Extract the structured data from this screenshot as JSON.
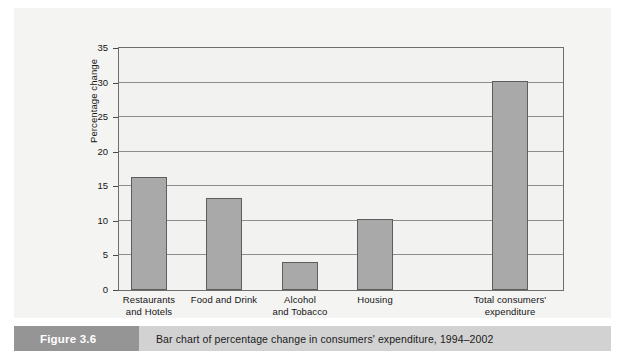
{
  "figure": {
    "tag_label": "Figure 3.6",
    "caption": "Bar chart of percentage change in consumers' expenditure, 1994–2002"
  },
  "colors": {
    "bar_fill": "#a9a9a9",
    "bar_outline": "#5d5d5d",
    "plot_background": "#f2f2f1",
    "panel_background": "#f4f4f3",
    "gridline": "#8d8d8d",
    "caption_bar": "#d2d2d2",
    "caption_tag": "#959595"
  },
  "chart_data": {
    "type": "bar",
    "title": "",
    "xlabel": "",
    "ylabel": "Percentage change",
    "ylim": [
      0,
      35
    ],
    "yticks": [
      0,
      5,
      10,
      15,
      20,
      25,
      30,
      35
    ],
    "ytick_labels": [
      "0",
      "5",
      "10",
      "15",
      "20",
      "25",
      "30",
      "35"
    ],
    "grid": "horizontal",
    "legend": "none",
    "categories": [
      "Restaurants and Hotels",
      "Food and Drink",
      "Alcohol and Tobacco",
      "Housing",
      "Total consumers' expenditure"
    ],
    "category_lines": [
      [
        "Restaurants",
        "and Hotels"
      ],
      [
        "Food and Drink"
      ],
      [
        "Alcohol",
        "and Tobacco"
      ],
      [
        "Housing"
      ],
      [
        "Total consumers'",
        "expenditure"
      ]
    ],
    "values": [
      16.4,
      13.3,
      4.0,
      10.3,
      30.2
    ]
  }
}
